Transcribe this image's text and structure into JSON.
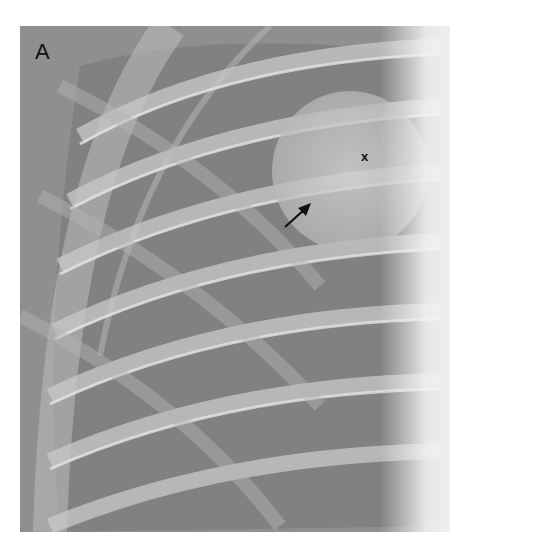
{
  "figure": {
    "panel_label": "A",
    "marker_label": "x",
    "arrow": {
      "from": [
        265,
        201
      ],
      "to": [
        291,
        177
      ],
      "color": "#111111"
    },
    "colors": {
      "background": "#8e8e8e",
      "lung_dark": "#6f6f6f",
      "rib": "#cfcfcf",
      "mediastinum": "#f4f4f4",
      "page": "#ffffff"
    }
  }
}
